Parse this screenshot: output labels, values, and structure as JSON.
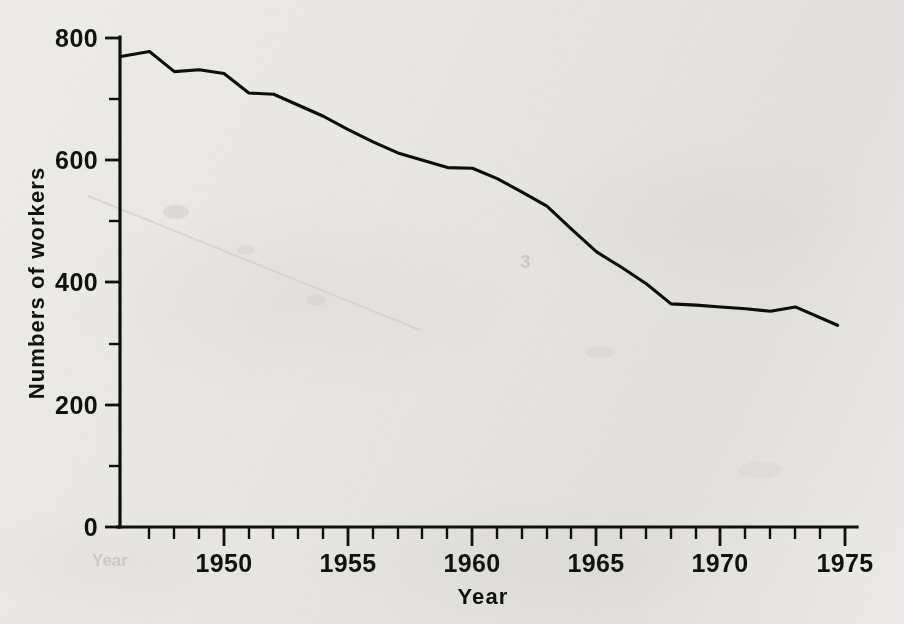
{
  "chart_data": {
    "type": "line",
    "title": "",
    "subtitle": "",
    "xlabel": "Year",
    "ylabel": "Numbers of workers",
    "xlim": [
      1945.8,
      1975.4
    ],
    "ylim": [
      0,
      800
    ],
    "grid": false,
    "legend": null,
    "legend_position": "none",
    "y_ticks_major": [
      0,
      200,
      400,
      600,
      800
    ],
    "y_tick_labels": [
      "0",
      "200",
      "400",
      "600",
      "800"
    ],
    "y_ticks_minor": [
      100,
      300,
      500,
      700
    ],
    "x_ticks_major": [
      1950,
      1955,
      1960,
      1965,
      1970,
      1975
    ],
    "x_tick_labels": [
      "1950",
      "1955",
      "1960",
      "1965",
      "1970",
      "1975"
    ],
    "x_ticks_minor": [
      1946,
      1947,
      1948,
      1949,
      1951,
      1952,
      1953,
      1954,
      1956,
      1957,
      1958,
      1959,
      1961,
      1962,
      1963,
      1964,
      1966,
      1967,
      1968,
      1969,
      1971,
      1972,
      1973,
      1974
    ],
    "x": [
      1945.9,
      1947.0,
      1948.0,
      1949.0,
      1950.0,
      1951.0,
      1952.0,
      1953.0,
      1954.0,
      1955.0,
      1956.0,
      1957.0,
      1958.0,
      1959.0,
      1960.0,
      1961.0,
      1962.0,
      1963.0,
      1964.0,
      1965.0,
      1966.0,
      1967.0,
      1968.0,
      1969.0,
      1970.0,
      1971.0,
      1972.0,
      1973.0,
      1974.7
    ],
    "values": [
      770,
      778,
      745,
      748,
      742,
      710,
      708,
      690,
      672,
      650,
      630,
      612,
      600,
      588,
      587,
      570,
      548,
      525,
      487,
      450,
      425,
      398,
      365,
      363,
      360,
      357,
      353,
      360,
      330
    ],
    "series": [
      {
        "name": "Numbers of workers",
        "color": "#0d0d0d",
        "values": [
          770,
          778,
          745,
          748,
          742,
          710,
          708,
          690,
          672,
          650,
          630,
          612,
          600,
          588,
          587,
          570,
          548,
          525,
          487,
          450,
          425,
          398,
          365,
          363,
          360,
          357,
          353,
          360,
          330
        ]
      }
    ],
    "annotations": []
  },
  "figure": {
    "background_color": "#ebe9e5",
    "line_color": "#0d0d0d",
    "axis_color": "#101010",
    "text_color": "#111111"
  },
  "axes": {
    "x_title": "Year",
    "y_title": "Numbers of workers"
  },
  "ghost_text": {
    "right_mid": "3",
    "bottom_left": "Year"
  }
}
